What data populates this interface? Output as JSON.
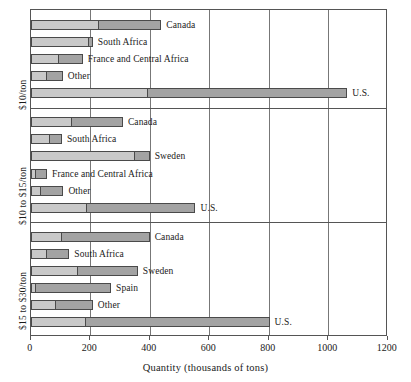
{
  "chart_data": {
    "type": "bar",
    "orientation": "horizontal",
    "stacked": true,
    "title": "",
    "xlabel": "Quantity (thousands of tons)",
    "ylabel": "",
    "xlim": [
      0,
      1200
    ],
    "xticks": [
      0,
      200,
      400,
      600,
      800,
      1000,
      1200
    ],
    "grid": true,
    "legend": "none",
    "series": [
      {
        "name": "segment-1",
        "color": "#c9c9c9"
      },
      {
        "name": "segment-2",
        "color": "#a3a3a3"
      }
    ],
    "panels": [
      {
        "label": "$10/ton",
        "bars": [
          {
            "name": "Canada",
            "segment1": 229,
            "segment2": 210,
            "total": 439
          },
          {
            "name": "South Africa",
            "segment1": 195,
            "segment2": 14,
            "total": 209
          },
          {
            "name": "France and Central Africa",
            "segment1": 96,
            "segment2": 79,
            "total": 175
          },
          {
            "name": "Other",
            "segment1": 54,
            "segment2": 54,
            "total": 108
          },
          {
            "name": "U.S.",
            "segment1": 394,
            "segment2": 670,
            "total": 1064
          }
        ]
      },
      {
        "label": "$10 to $15/ton",
        "bars": [
          {
            "name": "Canada",
            "segment1": 139,
            "segment2": 171,
            "total": 310
          },
          {
            "name": "South Africa",
            "segment1": 65,
            "segment2": 40,
            "total": 105
          },
          {
            "name": "Sweden",
            "segment1": 349,
            "segment2": 51,
            "total": 400
          },
          {
            "name": "France and Central Africa",
            "segment1": 18,
            "segment2": 37,
            "total": 55
          },
          {
            "name": "Other",
            "segment1": 35,
            "segment2": 75,
            "total": 110
          },
          {
            "name": "U.S.",
            "segment1": 189,
            "segment2": 365,
            "total": 554
          }
        ]
      },
      {
        "label": "$15 to $30/ton",
        "bars": [
          {
            "name": "Canada",
            "segment1": 106,
            "segment2": 294,
            "total": 400
          },
          {
            "name": "South Africa",
            "segment1": 54,
            "segment2": 76,
            "total": 130
          },
          {
            "name": "Sweden",
            "segment1": 158,
            "segment2": 202,
            "total": 360
          },
          {
            "name": "Spain",
            "segment1": 18,
            "segment2": 252,
            "total": 270
          },
          {
            "name": "Other",
            "segment1": 85,
            "segment2": 124,
            "total": 209
          },
          {
            "name": "U.S.",
            "segment1": 186,
            "segment2": 617,
            "total": 803
          }
        ]
      }
    ]
  },
  "axis": {
    "xticks": [
      "0",
      "200",
      "400",
      "600",
      "800",
      "1000",
      "1200"
    ],
    "xlabel": "Quantity (thousands of tons)"
  },
  "panel_labels": [
    "$10/ton",
    "$10 to $15/ton",
    "$15 to $30/ton"
  ],
  "colors": {
    "segment1": "#c9c9c9",
    "segment2": "#a3a3a3",
    "outline": "#4a4a4a",
    "grid": "#777777",
    "frame": "#555555",
    "text": "#1a1a1a",
    "background": "#ffffff"
  }
}
